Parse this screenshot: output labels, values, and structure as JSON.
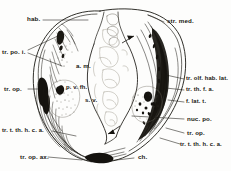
{
  "figure": {
    "type": "anatomical-line-drawing",
    "ink_color": "#1a1813",
    "background_color": "#fdfdfc"
  },
  "labels": {
    "habenula": "hab.",
    "stria_medullaris": "str. med.",
    "tractus_preopticus_inferior": "tr. po. i.",
    "tractus_opticus_left": "tr. op.",
    "tractus_olfacto_habenularis_lateralis": "tr. olf. hab. lat.",
    "tractus_thalamo_frontalis_anterior": "tr. th. f. a.",
    "fasciculus_lateralis_telencephali": "f. lat. t.",
    "nucleus_preopticus": "nuc. po.",
    "tractus_opticus_right": "tr. op.",
    "tractus_tecto_thalamo_hypothalamicus_cruciatus_anterior_left": "tr. t. th. h. c. a.",
    "tractus_tecto_thalamo_hypothalamicus_cruciatus_anterior_right": "tr. t. th. h. c. a.",
    "tractus_opticus_axialis": "tr. op. ax.",
    "chiasma": "ch.",
    "area_medialis": "a. m.",
    "paraventricularis_fasciculus_hypothalamicus": "p. v. fh.",
    "saccus_vasculosus": "s. v."
  }
}
